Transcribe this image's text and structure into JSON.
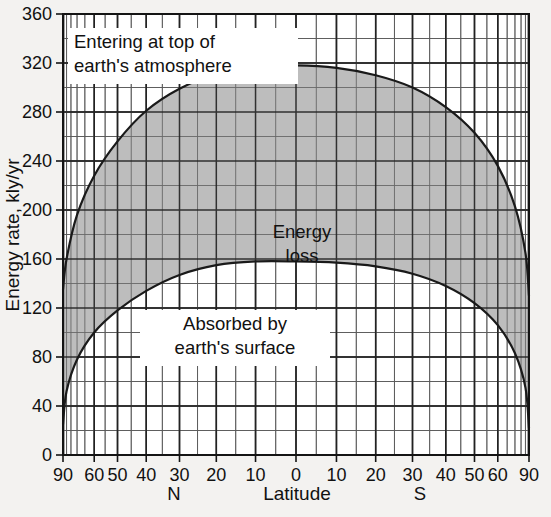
{
  "chart_data": {
    "type": "area",
    "title": "",
    "subtitle": "",
    "xlabel": "Latitude",
    "ylabel": "Energy rate, kly/yr",
    "ylim": [
      0,
      360
    ],
    "xlim_deg": [
      90,
      -90
    ],
    "x_scale": "sine-latitude",
    "grid": true,
    "legend_position": "inline-annotations",
    "y_major_ticks": [
      0,
      40,
      80,
      120,
      160,
      200,
      240,
      280,
      320,
      360
    ],
    "y_minor_step": 20,
    "x_tick_labels": [
      "90",
      "60",
      "50",
      "40",
      "30",
      "20",
      "10",
      "0",
      "10",
      "20",
      "30",
      "40",
      "50",
      "60",
      "90"
    ],
    "x_tick_values_deg": [
      90,
      60,
      50,
      40,
      30,
      20,
      10,
      0,
      -10,
      -20,
      -30,
      -40,
      -50,
      -60,
      -90
    ],
    "hemisphere_left": "N",
    "hemisphere_right": "S",
    "annotations": [
      {
        "name": "top-curve-label",
        "text": "Entering at top of\nearth's atmosphere",
        "line1": "Entering at top of",
        "line2": "earth's atmosphere"
      },
      {
        "name": "shaded-area-label",
        "text": "Energy\nloss",
        "line1": "Energy",
        "line2": "loss"
      },
      {
        "name": "bottom-curve-label",
        "text": "Absorbed by\nearth's surface",
        "line1": "Absorbed by",
        "line2": "earth's surface"
      }
    ],
    "series": [
      {
        "name": "Entering at top of earth's atmosphere",
        "x_deg": [
          90,
          80,
          70,
          60,
          50,
          40,
          30,
          20,
          10,
          0,
          -10,
          -20,
          -30,
          -40,
          -50,
          -60,
          -70,
          -80,
          -90
        ],
        "values": [
          135,
          160,
          196,
          228,
          256,
          281,
          299,
          311,
          317,
          318,
          316,
          310,
          300,
          284,
          263,
          236,
          203,
          165,
          130
        ]
      },
      {
        "name": "Absorbed by earth's surface",
        "x_deg": [
          90,
          80,
          70,
          60,
          50,
          40,
          30,
          20,
          10,
          0,
          -10,
          -20,
          -30,
          -40,
          -50,
          -60,
          -70,
          -80,
          -90
        ],
        "values": [
          25,
          52,
          78,
          100,
          118,
          134,
          147,
          155,
          158,
          158,
          157,
          154,
          148,
          138,
          124,
          106,
          83,
          55,
          22
        ]
      }
    ],
    "colors": {
      "fill": "#bdbdbd",
      "curve": "#1a1a1a",
      "grid_major": "#222222",
      "grid_minor": "#4a4a4a",
      "background": "#f3f2f0",
      "plot_background": "#ffffff"
    }
  }
}
